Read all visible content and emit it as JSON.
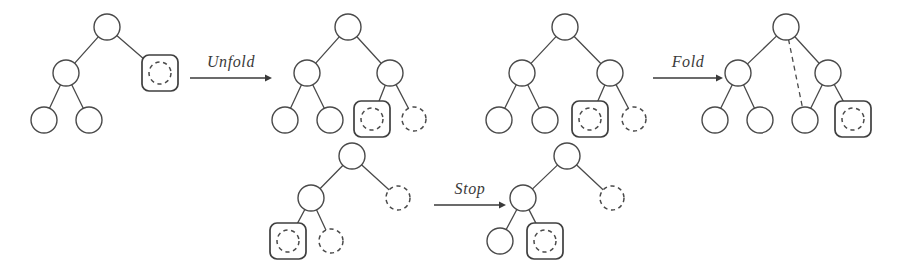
{
  "figure": {
    "background_color": "#ffffff",
    "ink_color": "#3a3a3a",
    "node_stroke_color": "#4a4a4a",
    "width": 897,
    "height": 280
  },
  "labels": {
    "unfold": "Unfold",
    "fold": "Fold",
    "stop": "Stop"
  },
  "legend": {
    "solid_circle": "solid-node",
    "dashed_circle": "dashed-node",
    "boxed_dashed_circle": "boxed-dashed-node",
    "solid_edge": "solid-edge",
    "dashed_edge": "dashed-edge"
  },
  "trees": [
    {
      "id": "tree-1",
      "name": "initial-tree",
      "nodes": [
        {
          "id": "t1-root",
          "style": "solid",
          "cx": 107,
          "cy": 27,
          "r": 13
        },
        {
          "id": "t1-left",
          "style": "solid",
          "cx": 66,
          "cy": 73,
          "r": 13
        },
        {
          "id": "t1-right",
          "style": "boxed-dashed",
          "cx": 160,
          "cy": 73,
          "r": 11
        },
        {
          "id": "t1-ll",
          "style": "solid",
          "cx": 44,
          "cy": 120,
          "r": 13
        },
        {
          "id": "t1-lr",
          "style": "solid",
          "cx": 89,
          "cy": 120,
          "r": 13
        }
      ],
      "edges": [
        {
          "from": "t1-root",
          "to": "t1-left",
          "style": "solid"
        },
        {
          "from": "t1-root",
          "to": "t1-right",
          "style": "solid"
        },
        {
          "from": "t1-left",
          "to": "t1-ll",
          "style": "solid"
        },
        {
          "from": "t1-left",
          "to": "t1-lr",
          "style": "solid"
        }
      ]
    },
    {
      "id": "tree-2",
      "name": "after-unfold-tree",
      "nodes": [
        {
          "id": "t2-root",
          "style": "solid",
          "cx": 348,
          "cy": 27,
          "r": 13
        },
        {
          "id": "t2-left",
          "style": "solid",
          "cx": 307,
          "cy": 73,
          "r": 13
        },
        {
          "id": "t2-right",
          "style": "solid",
          "cx": 390,
          "cy": 73,
          "r": 13
        },
        {
          "id": "t2-ll",
          "style": "solid",
          "cx": 285,
          "cy": 120,
          "r": 13
        },
        {
          "id": "t2-lr",
          "style": "solid",
          "cx": 330,
          "cy": 120,
          "r": 13
        },
        {
          "id": "t2-rl",
          "style": "boxed-dashed",
          "cx": 372,
          "cy": 119,
          "r": 11
        },
        {
          "id": "t2-rr",
          "style": "dashed",
          "cx": 414,
          "cy": 119,
          "r": 12
        }
      ],
      "edges": [
        {
          "from": "t2-root",
          "to": "t2-left",
          "style": "solid"
        },
        {
          "from": "t2-root",
          "to": "t2-right",
          "style": "solid"
        },
        {
          "from": "t2-left",
          "to": "t2-ll",
          "style": "solid"
        },
        {
          "from": "t2-left",
          "to": "t2-lr",
          "style": "solid"
        },
        {
          "from": "t2-right",
          "to": "t2-rl",
          "style": "solid"
        },
        {
          "from": "t2-right",
          "to": "t2-rr",
          "style": "solid"
        }
      ]
    },
    {
      "id": "tree-3",
      "name": "before-fold-tree",
      "nodes": [
        {
          "id": "t3-root",
          "style": "solid",
          "cx": 565,
          "cy": 27,
          "r": 13
        },
        {
          "id": "t3-left",
          "style": "solid",
          "cx": 522,
          "cy": 73,
          "r": 13
        },
        {
          "id": "t3-right",
          "style": "solid",
          "cx": 610,
          "cy": 73,
          "r": 13
        },
        {
          "id": "t3-ll",
          "style": "solid",
          "cx": 499,
          "cy": 120,
          "r": 13
        },
        {
          "id": "t3-lr",
          "style": "solid",
          "cx": 545,
          "cy": 120,
          "r": 13
        },
        {
          "id": "t3-rl",
          "style": "boxed-dashed",
          "cx": 590,
          "cy": 119,
          "r": 11
        },
        {
          "id": "t3-rr",
          "style": "dashed",
          "cx": 634,
          "cy": 119,
          "r": 12
        }
      ],
      "edges": [
        {
          "from": "t3-root",
          "to": "t3-left",
          "style": "solid"
        },
        {
          "from": "t3-root",
          "to": "t3-right",
          "style": "solid"
        },
        {
          "from": "t3-left",
          "to": "t3-ll",
          "style": "solid"
        },
        {
          "from": "t3-left",
          "to": "t3-lr",
          "style": "solid"
        },
        {
          "from": "t3-right",
          "to": "t3-rl",
          "style": "solid"
        },
        {
          "from": "t3-right",
          "to": "t3-rr",
          "style": "solid"
        }
      ]
    },
    {
      "id": "tree-4",
      "name": "after-fold-tree",
      "nodes": [
        {
          "id": "t4-root",
          "style": "solid",
          "cx": 786,
          "cy": 27,
          "r": 13
        },
        {
          "id": "t4-left",
          "style": "solid",
          "cx": 738,
          "cy": 73,
          "r": 13
        },
        {
          "id": "t4-right",
          "style": "solid",
          "cx": 828,
          "cy": 73,
          "r": 13
        },
        {
          "id": "t4-ll",
          "style": "solid",
          "cx": 715,
          "cy": 120,
          "r": 13
        },
        {
          "id": "t4-lr",
          "style": "solid",
          "cx": 760,
          "cy": 120,
          "r": 13
        },
        {
          "id": "t4-mid",
          "style": "solid",
          "cx": 805,
          "cy": 120,
          "r": 13
        },
        {
          "id": "t4-rr",
          "style": "boxed-dashed",
          "cx": 853,
          "cy": 119,
          "r": 11
        }
      ],
      "edges": [
        {
          "from": "t4-root",
          "to": "t4-left",
          "style": "solid"
        },
        {
          "from": "t4-root",
          "to": "t4-right",
          "style": "solid"
        },
        {
          "from": "t4-root",
          "to": "t4-mid",
          "style": "dashed"
        },
        {
          "from": "t4-left",
          "to": "t4-ll",
          "style": "solid"
        },
        {
          "from": "t4-left",
          "to": "t4-lr",
          "style": "solid"
        },
        {
          "from": "t4-right",
          "to": "t4-mid",
          "style": "solid"
        },
        {
          "from": "t4-right",
          "to": "t4-rr",
          "style": "solid"
        }
      ]
    },
    {
      "id": "tree-5",
      "name": "before-stop-tree",
      "nodes": [
        {
          "id": "t5-root",
          "style": "solid",
          "cx": 352,
          "cy": 156,
          "r": 13
        },
        {
          "id": "t5-left",
          "style": "solid",
          "cx": 311,
          "cy": 198,
          "r": 13
        },
        {
          "id": "t5-right",
          "style": "dashed",
          "cx": 398,
          "cy": 198,
          "r": 12
        },
        {
          "id": "t5-ll",
          "style": "boxed-dashed",
          "cx": 288,
          "cy": 241,
          "r": 11
        },
        {
          "id": "t5-lr",
          "style": "dashed",
          "cx": 331,
          "cy": 241,
          "r": 12
        }
      ],
      "edges": [
        {
          "from": "t5-root",
          "to": "t5-left",
          "style": "solid"
        },
        {
          "from": "t5-root",
          "to": "t5-right",
          "style": "solid"
        },
        {
          "from": "t5-left",
          "to": "t5-ll",
          "style": "solid"
        },
        {
          "from": "t5-left",
          "to": "t5-lr",
          "style": "solid"
        }
      ]
    },
    {
      "id": "tree-6",
      "name": "after-stop-tree",
      "nodes": [
        {
          "id": "t6-root",
          "style": "solid",
          "cx": 567,
          "cy": 156,
          "r": 13
        },
        {
          "id": "t6-left",
          "style": "solid",
          "cx": 523,
          "cy": 198,
          "r": 13
        },
        {
          "id": "t6-right",
          "style": "dashed",
          "cx": 612,
          "cy": 198,
          "r": 12
        },
        {
          "id": "t6-ll",
          "style": "solid",
          "cx": 500,
          "cy": 241,
          "r": 13
        },
        {
          "id": "t6-lr",
          "style": "boxed-dashed",
          "cx": 545,
          "cy": 241,
          "r": 11
        }
      ],
      "edges": [
        {
          "from": "t6-root",
          "to": "t6-left",
          "style": "solid"
        },
        {
          "from": "t6-root",
          "to": "t6-right",
          "style": "solid"
        },
        {
          "from": "t6-left",
          "to": "t6-ll",
          "style": "solid"
        },
        {
          "from": "t6-left",
          "to": "t6-lr",
          "style": "solid"
        }
      ]
    }
  ],
  "arrows": [
    {
      "id": "arrow-unfold",
      "label_key": "unfold",
      "x1": 190,
      "y1": 78,
      "x2": 272,
      "y2": 78,
      "label_x": 231,
      "label_y": 67
    },
    {
      "id": "arrow-fold",
      "label_key": "fold",
      "x1": 653,
      "y1": 78,
      "x2": 723,
      "y2": 78,
      "label_x": 688,
      "label_y": 67
    },
    {
      "id": "arrow-stop",
      "label_key": "stop",
      "x1": 434,
      "y1": 205,
      "x2": 506,
      "y2": 205,
      "label_x": 470,
      "label_y": 194
    }
  ]
}
